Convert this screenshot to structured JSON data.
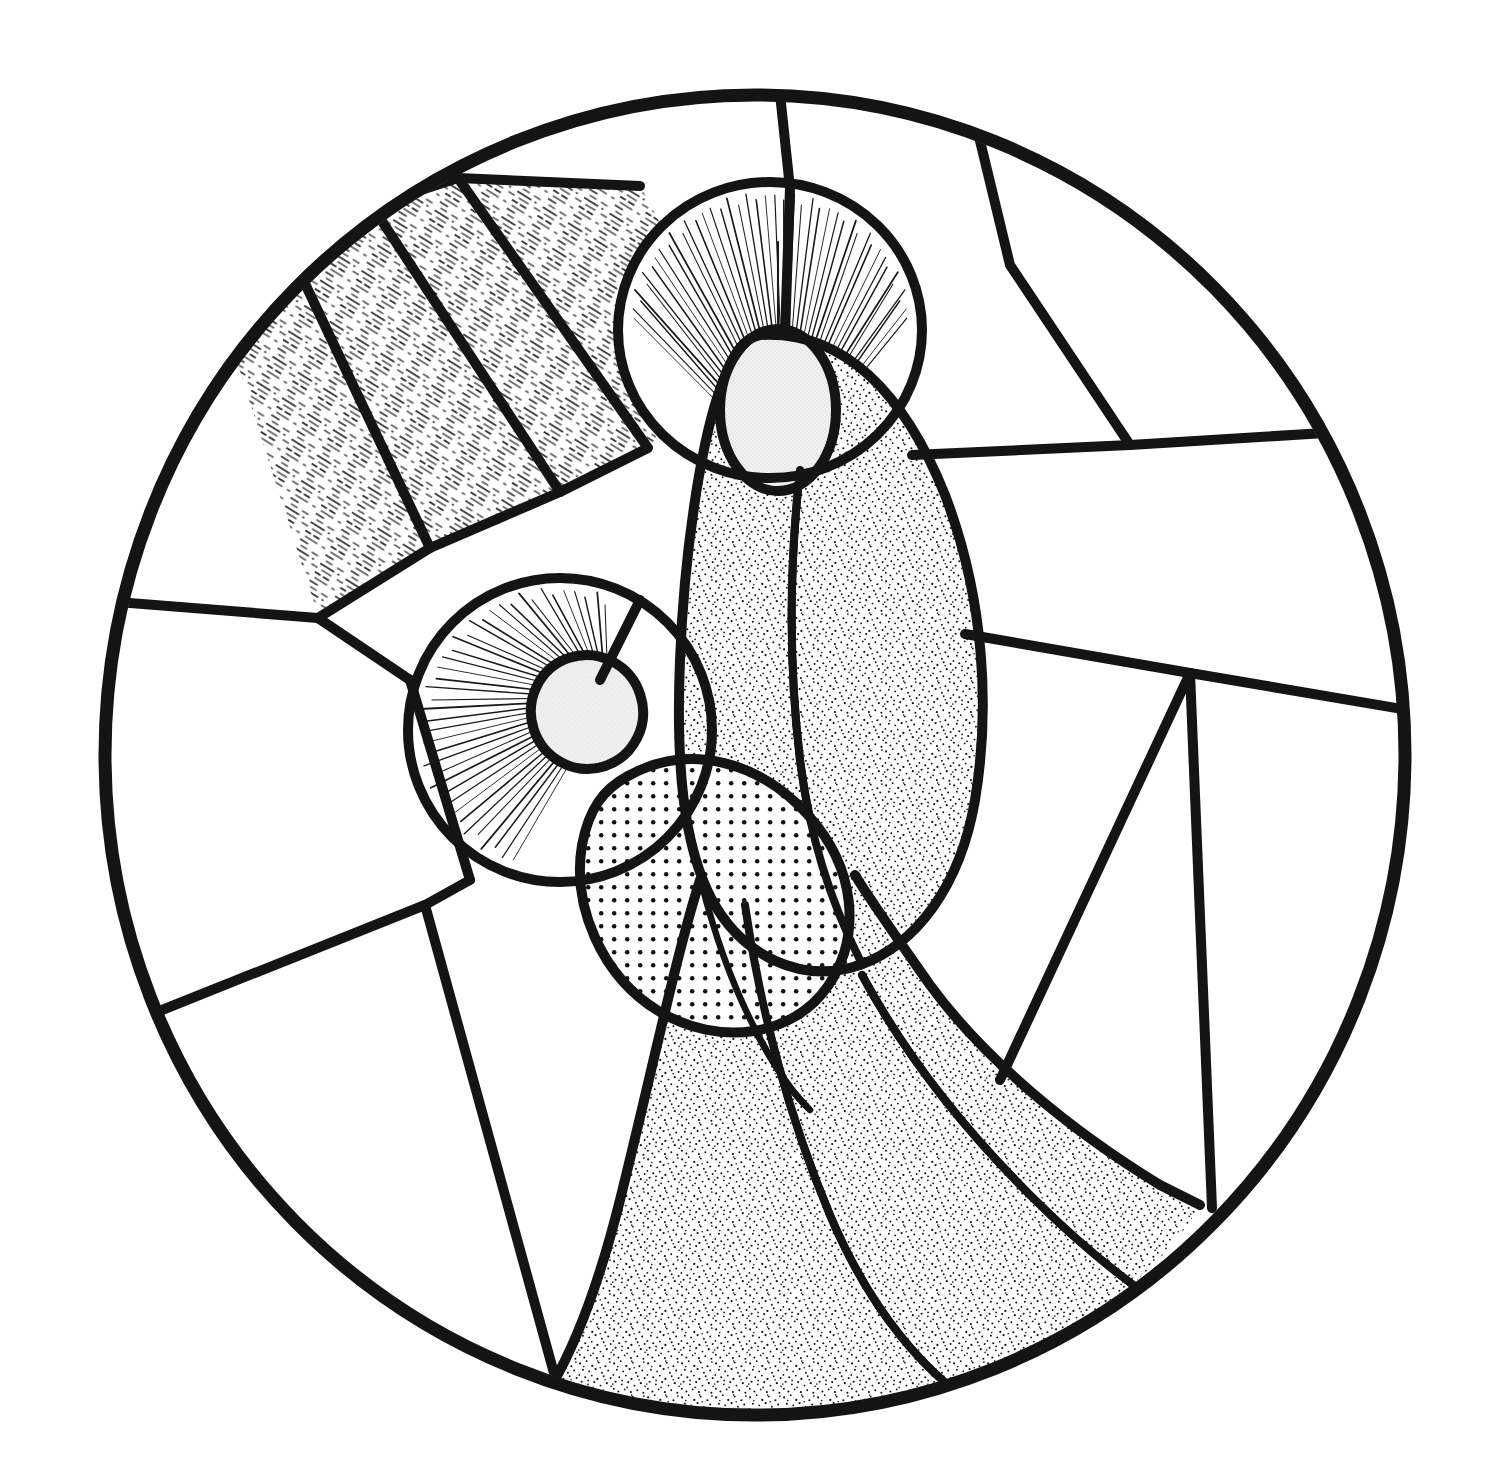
{
  "artwork": {
    "title": "Stained Glass Medallion — Two Haloed Figures",
    "medium": "pen-and-ink stained glass cartoon",
    "background_color": "#ffffff",
    "lead_color": "#141414",
    "canvas": {
      "width": 1512,
      "height": 1483
    }
  },
  "medallion": {
    "name": "circular-medallion",
    "center_x": 755,
    "center_y": 755,
    "radius_x": 650,
    "radius_y": 660,
    "border_width": 13
  },
  "palette": {
    "lead": "#141414",
    "glass_clear": "#ffffff",
    "face_fill": "#ececec",
    "robe_stipple_dark": "#6f6f6f",
    "robe_stipple_mid": "#8a8a8a",
    "hands_dot_fill": "#c9c9c9",
    "ray_hatch": "#3a3a3a"
  },
  "figures": [
    {
      "id": "upper-figure",
      "label": "Upper haloed figure",
      "halo": {
        "cx": 770,
        "cy": 330,
        "rx": 148,
        "ry": 145,
        "fill": "#ffffff",
        "has_radiating_lines": true,
        "ray_count": 44
      },
      "face": {
        "cx": 778,
        "cy": 410,
        "rx": 57,
        "ry": 80,
        "fill": "#ececec"
      },
      "robe_texture": "dense-random-stipple"
    },
    {
      "id": "lower-figure",
      "label": "Lower haloed figure",
      "halo": {
        "cx": 560,
        "cy": 730,
        "rx": 148,
        "ry": 150,
        "fill": "#ffffff",
        "has_radiating_lines": true,
        "ray_count": 40
      },
      "face": {
        "cx": 587,
        "cy": 712,
        "rx": 55,
        "ry": 56,
        "fill": "#ececec"
      },
      "robe_texture": "dense-random-stipple"
    }
  ],
  "glass_panels": [
    {
      "id": "panel-top-left-arc",
      "label": "Upper left clear arc",
      "texture": "clear"
    },
    {
      "id": "panel-top-center",
      "label": "Top center clear wedge",
      "texture": "clear"
    },
    {
      "id": "panel-top-right",
      "label": "Top right clear wedge",
      "texture": "clear"
    },
    {
      "id": "panel-right-upper",
      "label": "Right upper clear panel",
      "texture": "clear"
    },
    {
      "id": "panel-right-middle",
      "label": "Right middle clear panel",
      "texture": "clear"
    },
    {
      "id": "panel-right-lower",
      "label": "Right lower clear panel",
      "texture": "clear"
    },
    {
      "id": "panel-left-upper",
      "label": "Left upper clear panel",
      "texture": "clear"
    },
    {
      "id": "panel-left-middle",
      "label": "Left middle clear panel",
      "texture": "clear"
    },
    {
      "id": "panel-left-lower",
      "label": "Left lower clear panel",
      "texture": "clear"
    },
    {
      "id": "panel-bottom-left",
      "label": "Bottom left clear panel",
      "texture": "clear"
    },
    {
      "id": "ray-band-1",
      "label": "Light ray band 1",
      "texture": "diagonal-hatch"
    },
    {
      "id": "ray-band-2",
      "label": "Light ray band 2",
      "texture": "diagonal-hatch"
    },
    {
      "id": "ray-band-3",
      "label": "Light ray band 3",
      "texture": "diagonal-hatch"
    },
    {
      "id": "ray-band-4",
      "label": "Light ray band 4",
      "texture": "diagonal-hatch"
    },
    {
      "id": "robe-upper-left",
      "label": "Upper figure left robe",
      "texture": "stipple-dense"
    },
    {
      "id": "robe-upper-right",
      "label": "Upper figure right robe",
      "texture": "stipple-dense"
    },
    {
      "id": "robe-skirt-left",
      "label": "Lower skirt left",
      "texture": "stipple-dense"
    },
    {
      "id": "robe-skirt-center",
      "label": "Lower skirt center",
      "texture": "stipple-dense"
    },
    {
      "id": "robe-skirt-right",
      "label": "Lower skirt right sweep",
      "texture": "stipple-dense"
    },
    {
      "id": "hands-lens",
      "label": "Clasped hands lens",
      "texture": "regular-dot-grid"
    }
  ],
  "textures": {
    "stipple_dense": {
      "type": "random-stipple",
      "density": "high",
      "dot_size_px": 1.6
    },
    "dot_grid": {
      "type": "regular-dot-grid",
      "spacing_px": 13,
      "dot_radius_px": 2.4
    },
    "hatch": {
      "type": "broken-diagonal-lines",
      "angle_deg": 62,
      "spacing_px": 9
    }
  }
}
